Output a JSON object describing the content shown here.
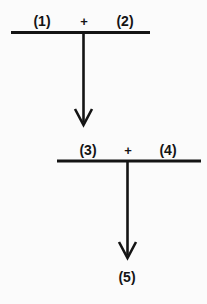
{
  "diagram": {
    "type": "reaction-scheme",
    "background_color": "#fbfbfb",
    "stroke_color": "#141414",
    "text_color": "#141414",
    "steps": [
      {
        "step_number": 1,
        "reactants": [
          {
            "id": "r1",
            "label": "(1)"
          },
          {
            "id": "r2",
            "label": "(2)"
          }
        ],
        "operator": "+",
        "arrow": {
          "direction": "down",
          "head_style": "open-v"
        }
      },
      {
        "step_number": 2,
        "reactants": [
          {
            "id": "r3",
            "label": "(3)"
          },
          {
            "id": "r4",
            "label": "(4)"
          }
        ],
        "operator": "+",
        "arrow": {
          "direction": "down",
          "head_style": "open-v"
        }
      }
    ],
    "product": {
      "id": "p5",
      "label": "(5)"
    },
    "labels": {
      "one": "(1)",
      "two": "(2)",
      "three": "(3)",
      "four": "(4)",
      "five": "(5)",
      "plus_top": "+",
      "plus_bottom": "+"
    }
  }
}
